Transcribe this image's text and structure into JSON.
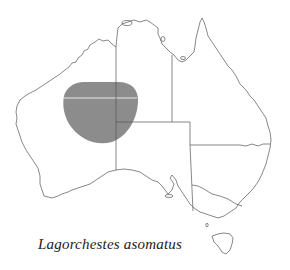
{
  "map": {
    "region": "Australia",
    "caption": "Lagorchestes asomatus",
    "distribution_color": "#8c8c8c",
    "outline_color": "#555555",
    "states": [
      "WA",
      "NT",
      "SA",
      "QLD",
      "NSW",
      "VIC",
      "TAS"
    ],
    "distribution_area": "central-western Australia straddling WA / NT / SA border junction"
  }
}
